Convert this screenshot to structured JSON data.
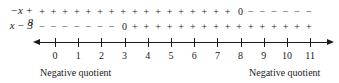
{
  "chart_data": {
    "type": "sign-chart",
    "title": "",
    "rows": [
      {
        "label": "−x + 8",
        "zero_at": 8,
        "signs_before_zero": "+",
        "signs_after_zero": "−"
      },
      {
        "label": "x − 3",
        "zero_at": 3,
        "signs_before_zero": "−",
        "signs_after_zero": "+"
      }
    ],
    "axis": {
      "ticks": [
        "0",
        "1",
        "2",
        "3",
        "4",
        "5",
        "6",
        "7",
        "8",
        "9",
        "10",
        "11"
      ],
      "range": [
        0,
        11
      ],
      "arrows": "both"
    },
    "annotations": [
      {
        "text": "Negative quotient",
        "position": "left"
      },
      {
        "text": "Negative quotient",
        "position": "right"
      }
    ]
  },
  "rows": {
    "r1": {
      "label": "−x + 8"
    },
    "r2": {
      "label": "x − 3"
    }
  },
  "annotations": {
    "left": "Negative quotient",
    "right": "Negative quotient"
  }
}
